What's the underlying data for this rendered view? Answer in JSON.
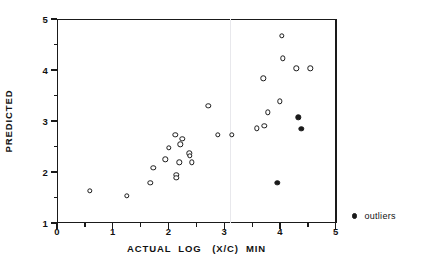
{
  "chart_data": {
    "type": "scatter",
    "title": "",
    "xlabel": "ACTUAL  LOG   (X/C)  MIN",
    "ylabel": "PREDICTED",
    "xlim": [
      0,
      5
    ],
    "ylim": [
      1,
      5
    ],
    "x_ticks": [
      "0",
      "1",
      "2",
      "3",
      "4",
      "5"
    ],
    "x_tick_values": [
      0,
      1,
      2,
      3,
      4,
      5
    ],
    "x_minor_tick_values": [
      0.5,
      1.5,
      2.5,
      3.5,
      4.5
    ],
    "y_ticks": [
      "1",
      "2",
      "3",
      "4",
      "5"
    ],
    "y_tick_values": [
      1,
      2,
      3,
      4,
      5
    ],
    "y_minor_tick_values": [
      1.5,
      2.5,
      3.5,
      4.5
    ],
    "grid": false,
    "legend_position": "right",
    "guide_x": 3.1,
    "series": [
      {
        "name": "data",
        "marker": "open-circle",
        "color": "#1a1a1a",
        "points": [
          {
            "x": 0.59,
            "y": 1.63
          },
          {
            "x": 1.25,
            "y": 1.53
          },
          {
            "x": 1.67,
            "y": 1.79
          },
          {
            "x": 1.73,
            "y": 2.08
          },
          {
            "x": 1.94,
            "y": 2.25
          },
          {
            "x": 2.01,
            "y": 2.47
          },
          {
            "x": 2.12,
            "y": 2.73
          },
          {
            "x": 2.14,
            "y": 1.95
          },
          {
            "x": 2.14,
            "y": 1.89
          },
          {
            "x": 2.19,
            "y": 2.19
          },
          {
            "x": 2.21,
            "y": 2.54
          },
          {
            "x": 2.25,
            "y": 2.65
          },
          {
            "x": 2.37,
            "y": 2.37
          },
          {
            "x": 2.38,
            "y": 2.32
          },
          {
            "x": 2.42,
            "y": 2.19
          },
          {
            "x": 2.71,
            "y": 3.3
          },
          {
            "x": 2.88,
            "y": 2.73
          },
          {
            "x": 3.13,
            "y": 2.73
          },
          {
            "x": 3.58,
            "y": 2.86
          },
          {
            "x": 3.72,
            "y": 2.9
          },
          {
            "x": 3.7,
            "y": 3.84
          },
          {
            "x": 3.78,
            "y": 3.17
          },
          {
            "x": 4.0,
            "y": 3.39
          },
          {
            "x": 4.03,
            "y": 4.67
          },
          {
            "x": 4.05,
            "y": 4.23
          },
          {
            "x": 4.29,
            "y": 4.03
          },
          {
            "x": 4.54,
            "y": 4.03
          }
        ]
      },
      {
        "name": "outliers",
        "marker": "filled-circle",
        "color": "#1a1a1a",
        "points": [
          {
            "x": 3.95,
            "y": 1.79
          },
          {
            "x": 4.33,
            "y": 3.07
          },
          {
            "x": 4.38,
            "y": 2.85
          }
        ]
      }
    ]
  },
  "legend": {
    "entries": [
      {
        "label": "outliers",
        "marker": "filled-circle"
      }
    ]
  }
}
